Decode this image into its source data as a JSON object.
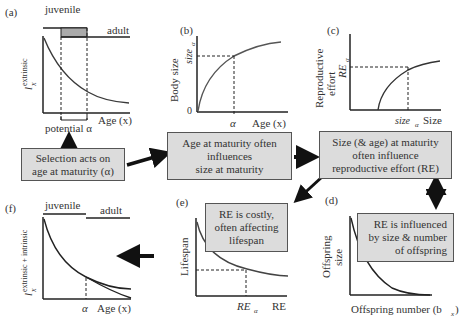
{
  "panels": {
    "a": {
      "label": "(a)",
      "stage_juvenile": "juvenile",
      "stage_adult": "adult",
      "ylabel_main": "l",
      "ylabel_sup": "extrinsic",
      "ylabel_sub": "x",
      "xlabel": "Age (x)",
      "bracket_label": "potential α"
    },
    "b": {
      "label": "(b)",
      "ylabel": "Body size",
      "y_tick_zero": "0",
      "y_marker": "size",
      "y_marker_sub": "α",
      "x_marker": "α",
      "xlabel": "Age (x)"
    },
    "c": {
      "label": "(c)",
      "ylabel_line1": "Reproductive",
      "ylabel_line2": "effort",
      "y_marker": "RE",
      "y_marker_sub": "α",
      "x_marker": "size",
      "x_marker_sub": "α",
      "xlabel": "Size"
    },
    "d": {
      "label": "(d)",
      "ylabel_line1": "Offspring",
      "ylabel_line2": "size",
      "xlabel": "Offspring number (b",
      "xlabel_sub": "x",
      "xlabel_end": ")"
    },
    "e": {
      "label": "(e)",
      "ylabel": "Lifespan",
      "x_marker": "RE",
      "x_marker_sub": "α",
      "xlabel": "RE"
    },
    "f": {
      "label": "(f)",
      "stage_juvenile": "juvenile",
      "stage_adult": "adult",
      "ylabel_main": "l",
      "ylabel_sup": "extrinsic + intrinsic",
      "ylabel_sub": "x",
      "x_marker": "α",
      "xlabel": "Age (x)"
    }
  },
  "boxes": {
    "selection": [
      "Selection acts on",
      "age at maturity (α)"
    ],
    "age_size": [
      "Age at maturity often",
      "influences",
      "size at maturity"
    ],
    "size_re": [
      "Size (& age) at maturity",
      "often influence",
      "reproductive effort (RE)"
    ],
    "re_offspring": [
      "RE is influenced",
      "by size & number",
      "of offspring"
    ],
    "re_costly": [
      "RE is costly,",
      "often affecting",
      "lifespan"
    ]
  },
  "colors": {
    "box_fill": "#dcdcdc",
    "box_border": "#555555",
    "curve": "#333333",
    "shade": "#aaaaaa"
  }
}
